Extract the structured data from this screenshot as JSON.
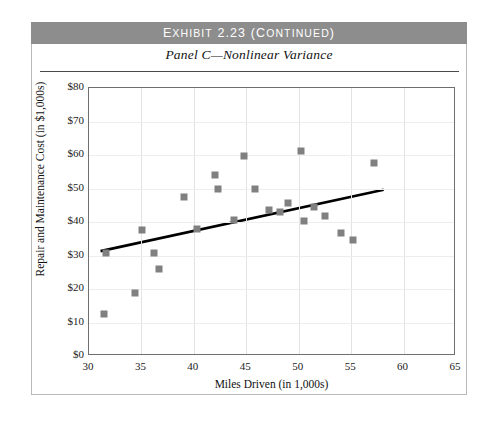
{
  "exhibit": {
    "banner_title": "Exhibit 2.23 (Continued)",
    "banner_title_main": "Exhibit 2.23",
    "banner_title_suffix": "(Continued)",
    "panel_title": "Panel C—Nonlinear Variance"
  },
  "colors": {
    "banner_background": "#8d8d8d",
    "banner_text": "#ffffff",
    "marker": "#808080",
    "trendline": "#000000",
    "plot_border": "#6f6f6f",
    "gridline": "#e6e6e6",
    "page_background": "#ffffff"
  },
  "chart_data": {
    "type": "scatter",
    "title": "Panel C—Nonlinear Variance",
    "xlabel": "Miles Driven (in 1,000s)",
    "ylabel": "Repair and Maintenance Cost (in $1,000s)",
    "xlim": [
      30,
      65
    ],
    "ylim": [
      0,
      80
    ],
    "xticks": [
      30,
      35,
      40,
      45,
      50,
      55,
      60,
      65
    ],
    "yticks": [
      0,
      10,
      20,
      30,
      40,
      50,
      60,
      70,
      80
    ],
    "xtick_labels": [
      "30",
      "35",
      "40",
      "45",
      "50",
      "55",
      "60",
      "65"
    ],
    "ytick_labels": [
      "$0",
      "$10",
      "$20",
      "$30",
      "$40",
      "$50",
      "$60",
      "$70",
      "$80"
    ],
    "grid": true,
    "legend": null,
    "series": [
      {
        "name": "Repair and Maintenance Cost",
        "marker": "square",
        "color": "#808080",
        "points": [
          {
            "x": 31.4,
            "y": 12.5
          },
          {
            "x": 31.6,
            "y": 30.6
          },
          {
            "x": 34.4,
            "y": 18.7
          },
          {
            "x": 35.1,
            "y": 37.6
          },
          {
            "x": 36.2,
            "y": 30.6
          },
          {
            "x": 36.7,
            "y": 26.0
          },
          {
            "x": 39.1,
            "y": 47.5
          },
          {
            "x": 40.3,
            "y": 37.9
          },
          {
            "x": 42.0,
            "y": 54.0
          },
          {
            "x": 42.3,
            "y": 50.0
          },
          {
            "x": 43.8,
            "y": 40.6
          },
          {
            "x": 44.8,
            "y": 59.6
          },
          {
            "x": 45.8,
            "y": 50.0
          },
          {
            "x": 47.2,
            "y": 43.6
          },
          {
            "x": 48.2,
            "y": 42.9
          },
          {
            "x": 49.0,
            "y": 45.6
          },
          {
            "x": 50.2,
            "y": 61.3
          },
          {
            "x": 50.5,
            "y": 40.3
          },
          {
            "x": 51.5,
            "y": 44.4
          },
          {
            "x": 52.5,
            "y": 41.8
          },
          {
            "x": 54.0,
            "y": 36.6
          },
          {
            "x": 55.2,
            "y": 34.5
          },
          {
            "x": 57.2,
            "y": 57.6
          }
        ]
      }
    ],
    "trendline": {
      "name": "Least squares regression line",
      "color": "#000000",
      "x_start": 31.1,
      "y_start": 31.3,
      "x_end": 58.1,
      "y_end": 49.6
    }
  }
}
